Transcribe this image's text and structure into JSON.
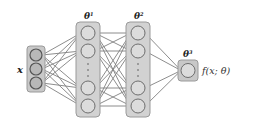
{
  "diagram": {
    "type": "feedforward-neural-network",
    "input_label": "x",
    "layers": [
      {
        "name": "input",
        "label": "x",
        "nodes_shown": 3,
        "ellipsis": false
      },
      {
        "name": "hidden-1",
        "label": "θ",
        "superscript": "1",
        "nodes_shown": 4,
        "ellipsis": true
      },
      {
        "name": "hidden-2",
        "label": "θ",
        "superscript": "2",
        "nodes_shown": 4,
        "ellipsis": true
      },
      {
        "name": "output",
        "label": "θ",
        "superscript": "3",
        "nodes_shown": 1,
        "ellipsis": false
      }
    ],
    "output_label": "f(x; θ)",
    "colors": {
      "box_fill": "#c8c8c8",
      "box_stroke": "#9a9a9a",
      "node_fill": "#dcdcdc",
      "node_stroke": "#6e6e6e",
      "edge": "#808080",
      "text": "#222222"
    }
  }
}
